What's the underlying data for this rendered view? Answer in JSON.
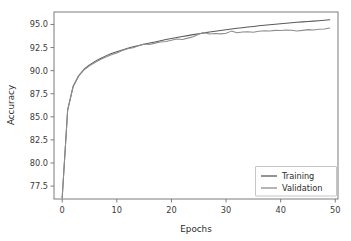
{
  "chart_data": {
    "type": "line",
    "title": "",
    "xlabel": "Epochs",
    "ylabel": "Accuracy",
    "xlim": [
      -1.5,
      50.5
    ],
    "ylim": [
      76.1,
      96.35
    ],
    "grid": false,
    "legend_position": "lower right",
    "xticks": [
      0,
      10,
      20,
      30,
      40,
      50
    ],
    "xtick_labels": [
      "0",
      "10",
      "20",
      "30",
      "40",
      "50"
    ],
    "yticks": [
      77.5,
      80.0,
      82.5,
      85.0,
      87.5,
      90.0,
      92.5,
      95.0
    ],
    "ytick_labels": [
      "77.5",
      "80.0",
      "82.5",
      "85.0",
      "87.5",
      "90.0",
      "92.5",
      "95.0"
    ],
    "x": [
      0,
      1,
      2,
      3,
      4,
      5,
      6,
      7,
      8,
      9,
      10,
      11,
      12,
      13,
      14,
      15,
      16,
      17,
      18,
      19,
      20,
      21,
      22,
      23,
      24,
      25,
      26,
      27,
      28,
      29,
      30,
      31,
      32,
      33,
      34,
      35,
      36,
      37,
      38,
      39,
      40,
      41,
      42,
      43,
      44,
      45,
      46,
      47,
      48,
      49
    ],
    "series": [
      {
        "name": "Training",
        "color": "#5a5a5a",
        "values": [
          76.2,
          85.75,
          88.3,
          89.45,
          90.15,
          90.62,
          91.0,
          91.32,
          91.6,
          91.85,
          92.05,
          92.24,
          92.42,
          92.58,
          92.73,
          92.86,
          92.99,
          93.11,
          93.24,
          93.36,
          93.47,
          93.58,
          93.69,
          93.79,
          93.9,
          94.0,
          94.09,
          94.18,
          94.27,
          94.35,
          94.43,
          94.51,
          94.58,
          94.65,
          94.72,
          94.79,
          94.85,
          94.91,
          94.97,
          95.02,
          95.08,
          95.13,
          95.18,
          95.23,
          95.28,
          95.32,
          95.36,
          95.41,
          95.45,
          95.5
        ]
      },
      {
        "name": "Validation",
        "color": "#8d8d8d",
        "values": [
          76.25,
          85.7,
          88.25,
          89.4,
          90.08,
          90.52,
          90.88,
          91.2,
          91.48,
          91.72,
          91.92,
          92.18,
          92.38,
          92.48,
          92.7,
          92.88,
          92.82,
          92.98,
          93.1,
          93.16,
          93.28,
          93.42,
          93.38,
          93.52,
          93.68,
          93.95,
          94.12,
          93.96,
          94.02,
          93.98,
          94.04,
          94.28,
          94.1,
          94.18,
          94.22,
          94.16,
          94.26,
          94.32,
          94.3,
          94.36,
          94.34,
          94.4,
          94.38,
          94.3,
          94.36,
          94.44,
          94.4,
          94.48,
          94.52,
          94.62
        ]
      }
    ]
  },
  "legend": {
    "entries": [
      {
        "label": "Training"
      },
      {
        "label": "Validation"
      }
    ]
  },
  "axes": {
    "xlabel": "Epochs",
    "ylabel": "Accuracy"
  }
}
